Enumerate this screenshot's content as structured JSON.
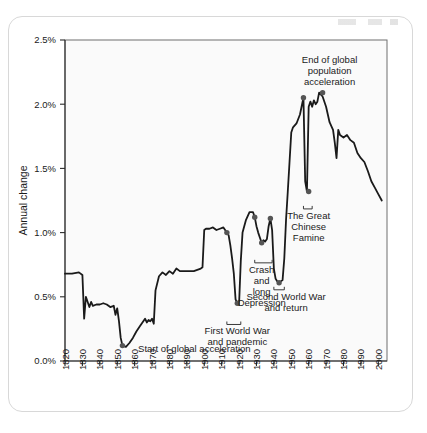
{
  "figure": {
    "container_name": "chart-card",
    "background_color": "#ffffff",
    "plot_background_color": "#fafafa",
    "border_color": "#d8d8d8",
    "line_color": "#1a1a1a",
    "marker_color": "#555555"
  },
  "chart_data": {
    "type": "line",
    "title": "",
    "xlabel": "",
    "ylabel": "Annual change",
    "xlim": [
      1820,
      2005
    ],
    "ylim": [
      0.0,
      2.5
    ],
    "grid": false,
    "legend": "none",
    "y_tick_labels": [
      "0.0%",
      "0.5%",
      "1.0%",
      "1.5%",
      "2.0%",
      "2.5%"
    ],
    "y_tick_values": [
      0.0,
      0.5,
      1.0,
      1.5,
      2.0,
      2.5
    ],
    "x_tick_labels": [
      "1820",
      "1830",
      "1840",
      "1850",
      "1860",
      "1870",
      "1880",
      "1890",
      "1900",
      "1910",
      "1920",
      "1930",
      "1940",
      "1950",
      "1960",
      "1970",
      "1980",
      "1990",
      "2000"
    ],
    "x_tick_values": [
      1820,
      1830,
      1840,
      1850,
      1860,
      1870,
      1880,
      1890,
      1900,
      1910,
      1920,
      1930,
      1940,
      1950,
      1960,
      1970,
      1980,
      1990,
      2000
    ],
    "series": [
      {
        "name": "World population annual change",
        "x": [
          1820,
          1824,
          1828,
          1830,
          1831,
          1832,
          1834,
          1835,
          1836,
          1838,
          1840,
          1842,
          1844,
          1845,
          1846,
          1848,
          1849,
          1850,
          1851,
          1852,
          1853,
          1855,
          1857,
          1859,
          1861,
          1863,
          1865,
          1866,
          1867,
          1868,
          1869,
          1870,
          1871,
          1872,
          1874,
          1876,
          1878,
          1880,
          1882,
          1884,
          1886,
          1888,
          1890,
          1892,
          1894,
          1896,
          1898,
          1899,
          1900,
          1901,
          1903,
          1905,
          1907,
          1909,
          1911,
          1913,
          1914,
          1915,
          1916,
          1917,
          1918,
          1919,
          1920,
          1921,
          1922,
          1924,
          1926,
          1928,
          1929,
          1930,
          1931,
          1932,
          1933,
          1934,
          1935,
          1936,
          1937,
          1938,
          1939,
          1940,
          1941,
          1942,
          1943,
          1944,
          1945,
          1946,
          1947,
          1948,
          1949,
          1950,
          1951,
          1953,
          1955,
          1957,
          1958,
          1959,
          1960,
          1961,
          1962,
          1963,
          1964,
          1965,
          1966,
          1968,
          1970,
          1971,
          1972,
          1974,
          1975,
          1976,
          1977,
          1978,
          1980,
          1982,
          1984,
          1986,
          1988,
          1990,
          1992,
          1994,
          1996,
          1998,
          2000,
          2002
        ],
        "y": [
          0.68,
          0.68,
          0.69,
          0.67,
          0.33,
          0.5,
          0.42,
          0.46,
          0.43,
          0.44,
          0.44,
          0.45,
          0.44,
          0.43,
          0.42,
          0.43,
          0.36,
          0.41,
          0.31,
          0.18,
          0.12,
          0.11,
          0.14,
          0.18,
          0.23,
          0.27,
          0.31,
          0.33,
          0.3,
          0.32,
          0.31,
          0.33,
          0.29,
          0.55,
          0.66,
          0.69,
          0.67,
          0.7,
          0.68,
          0.72,
          0.7,
          0.7,
          0.7,
          0.7,
          0.7,
          0.71,
          0.72,
          0.73,
          1.02,
          1.03,
          1.03,
          1.04,
          1.02,
          1.03,
          1.04,
          1.0,
          0.98,
          0.9,
          0.8,
          0.68,
          0.48,
          0.45,
          0.44,
          0.78,
          1.0,
          1.1,
          1.16,
          1.16,
          1.12,
          1.05,
          1.0,
          0.96,
          0.92,
          0.94,
          0.93,
          0.95,
          1.05,
          1.11,
          1.02,
          0.72,
          0.64,
          0.62,
          0.61,
          0.62,
          0.63,
          0.8,
          1.1,
          1.32,
          1.55,
          1.78,
          1.82,
          1.85,
          1.92,
          2.05,
          1.4,
          1.32,
          1.98,
          2.02,
          1.98,
          2.03,
          2.0,
          2.02,
          2.09,
          2.06,
          1.98,
          1.92,
          1.86,
          1.8,
          1.7,
          1.58,
          1.8,
          1.76,
          1.74,
          1.76,
          1.72,
          1.7,
          1.62,
          1.58,
          1.55,
          1.48,
          1.4,
          1.35,
          1.3,
          1.25
        ],
        "units": "percent"
      }
    ],
    "markers": [
      {
        "label": "start-of-global-acceleration",
        "x": 1853,
        "y": 0.12
      },
      {
        "label": "first-world-war-start",
        "x": 1913,
        "y": 1.0
      },
      {
        "label": "first-world-war-trough",
        "x": 1919,
        "y": 0.45
      },
      {
        "label": "crash-and-depression-start",
        "x": 1929,
        "y": 1.12
      },
      {
        "label": "crash-and-depression-trough",
        "x": 1933,
        "y": 0.92
      },
      {
        "label": "crash-and-depression-end",
        "x": 1938,
        "y": 1.11
      },
      {
        "label": "second-world-war-trough",
        "x": 1943,
        "y": 0.61
      },
      {
        "label": "great-chinese-famine-peak",
        "x": 1957,
        "y": 2.05
      },
      {
        "label": "great-chinese-famine-trough",
        "x": 1960,
        "y": 1.32
      },
      {
        "label": "end-of-global-population-acceleration",
        "x": 1968,
        "y": 2.09
      }
    ],
    "annotations": [
      {
        "name": "start-of-global-acceleration",
        "text": "Start of global acceleration",
        "x": 1862,
        "y": 0.1,
        "bracket": false
      },
      {
        "name": "first-world-war-and-pandemic",
        "text": "First World War and pandemic",
        "lines": [
          "First World War",
          "and pandemic"
        ],
        "x": 1919,
        "y": 0.3,
        "bracket": true,
        "bracket_from": 1913,
        "bracket_to": 1921
      },
      {
        "name": "crash-and-long-depression",
        "text": "Crash and long Depression",
        "lines": [
          "Crash",
          "and",
          "long",
          "Depression"
        ],
        "x": 1933,
        "y": 0.78,
        "bracket": true,
        "bracket_from": 1929,
        "bracket_to": 1939
      },
      {
        "name": "second-world-war-and-return",
        "text": "Second World War and return",
        "lines": [
          "Second World War",
          "and return"
        ],
        "x": 1947,
        "y": 0.57,
        "bracket": true,
        "bracket_from": 1940,
        "bracket_to": 1946
      },
      {
        "name": "the-great-chinese-famine",
        "text": "The Great Chinese Famine",
        "lines": [
          "The Great",
          "Chinese",
          "Famine"
        ],
        "x": 1960,
        "y": 1.2,
        "bracket": true,
        "bracket_from": 1957,
        "bracket_to": 1962
      },
      {
        "name": "end-of-global-population-acceleration",
        "text": "End of global population acceleration",
        "lines": [
          "End of global",
          "population",
          "acceleration"
        ],
        "x": 1972,
        "y": 2.35,
        "bracket": false
      }
    ]
  }
}
